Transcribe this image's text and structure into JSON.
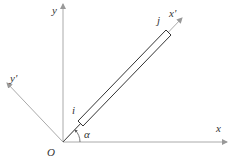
{
  "diagram": {
    "labels": {
      "origin": "O",
      "x_axis": "x",
      "y_axis": "y",
      "x_prime_axis": "x'",
      "y_prime_axis": "y'",
      "node_i": "i",
      "node_j": "j",
      "angle": "α"
    },
    "colors": {
      "axis": "#aaaaaa",
      "element": "#333333",
      "text": "#333333"
    }
  }
}
